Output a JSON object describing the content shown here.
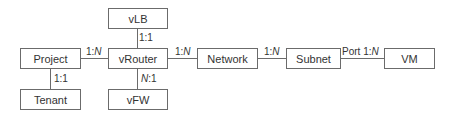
{
  "diagram": {
    "type": "entity-relationship",
    "colors": {
      "box_border": "#6b6b6b",
      "line": "#6b6b6b",
      "text": "#333333",
      "background": "#ffffff"
    },
    "nodes": [
      {
        "id": "project",
        "label": "Project"
      },
      {
        "id": "tenant",
        "label": "Tenant"
      },
      {
        "id": "vlb",
        "label": "vLB"
      },
      {
        "id": "vrouter",
        "label": "vRouter"
      },
      {
        "id": "vfw",
        "label": "vFW"
      },
      {
        "id": "network",
        "label": "Network"
      },
      {
        "id": "subnet",
        "label": "Subnet"
      },
      {
        "id": "vm",
        "label": "VM"
      }
    ],
    "edges": [
      {
        "from": "project",
        "to": "vrouter",
        "label_prefix": "",
        "label_left": "1:",
        "label_right": "N"
      },
      {
        "from": "project",
        "to": "tenant",
        "label_prefix": "",
        "label_left": "1:",
        "label_right": "1"
      },
      {
        "from": "vrouter",
        "to": "vlb",
        "label_prefix": "",
        "label_left": "1:",
        "label_right": "1"
      },
      {
        "from": "vrouter",
        "to": "vfw",
        "label_prefix": "",
        "label_left": "N",
        "label_right": ":1"
      },
      {
        "from": "vrouter",
        "to": "network",
        "label_prefix": "",
        "label_left": "1:",
        "label_right": "N"
      },
      {
        "from": "network",
        "to": "subnet",
        "label_prefix": "",
        "label_left": "1:",
        "label_right": "N"
      },
      {
        "from": "subnet",
        "to": "vm",
        "label_prefix": "Port ",
        "label_left": "1:",
        "label_right": "N"
      }
    ]
  }
}
